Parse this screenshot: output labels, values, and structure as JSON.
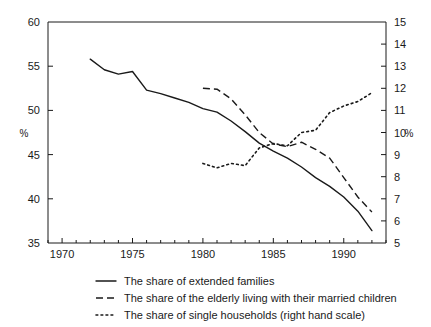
{
  "chart_data": {
    "type": "line",
    "title": "",
    "xlabel": "",
    "ylabel": "%",
    "y2label": "%",
    "xlim": [
      1969,
      1993
    ],
    "ylim": [
      35,
      60
    ],
    "y2lim": [
      5,
      15
    ],
    "grid": false,
    "legend_position": "below",
    "x_ticks": [
      1970,
      1975,
      1980,
      1985,
      1990
    ],
    "x_tick_labels": [
      "1970",
      "1975",
      "1980",
      "1985",
      "1990"
    ],
    "x_minor_step": 1,
    "y_ticks": [
      35,
      40,
      45,
      50,
      55,
      60
    ],
    "y_tick_labels": [
      "35",
      "40",
      "45",
      "50",
      "55",
      "60"
    ],
    "y2_ticks": [
      5,
      6,
      7,
      8,
      9,
      10,
      11,
      12,
      13,
      14,
      15
    ],
    "y2_tick_labels": [
      "5",
      "6",
      "7",
      "8",
      "9",
      "10",
      "11",
      "12",
      "13",
      "14",
      "15"
    ],
    "series": [
      {
        "name": "The share of extended families",
        "style": "solid",
        "axis": "left",
        "x": [
          1972,
          1973,
          1974,
          1975,
          1976,
          1977,
          1978,
          1979,
          1980,
          1981,
          1982,
          1983,
          1984,
          1985,
          1986,
          1987,
          1988,
          1989,
          1990,
          1991,
          1992
        ],
        "values": [
          55.8,
          54.6,
          54.1,
          54.4,
          52.3,
          51.9,
          51.4,
          50.9,
          50.2,
          49.8,
          48.8,
          47.6,
          46.3,
          45.4,
          44.6,
          43.6,
          42.4,
          41.4,
          40.2,
          38.6,
          36.4
        ]
      },
      {
        "name": "The share of the elderly living with their married children",
        "style": "dashed",
        "axis": "left",
        "x": [
          1980,
          1981,
          1982,
          1983,
          1984,
          1985,
          1986,
          1987,
          1988,
          1989,
          1990,
          1991,
          1992
        ],
        "values": [
          52.5,
          52.4,
          51.3,
          49.5,
          47.5,
          46.2,
          45.9,
          46.4,
          45.6,
          44.6,
          42.4,
          40.2,
          38.5
        ]
      },
      {
        "name": "The share of single households (right hand scale)",
        "style": "dotted",
        "axis": "right",
        "x": [
          1980,
          1981,
          1982,
          1983,
          1984,
          1985,
          1986,
          1987,
          1988,
          1989,
          1990,
          1991,
          1992
        ],
        "values": [
          8.6,
          8.4,
          8.6,
          8.5,
          9.3,
          9.5,
          9.4,
          10.0,
          10.1,
          10.9,
          11.2,
          11.4,
          11.8
        ]
      }
    ],
    "legend": [
      {
        "marker": "solid-line-marker",
        "label": "The share of extended families"
      },
      {
        "marker": "dashed-line-marker",
        "label": "The share of the elderly living with their married children"
      },
      {
        "marker": "dotted-line-marker",
        "label": "The share of single households (right hand scale)"
      }
    ],
    "colors": {
      "ink": "#1a1a1a",
      "background": "#ffffff"
    }
  }
}
